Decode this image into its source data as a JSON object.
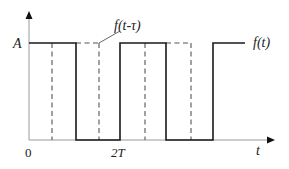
{
  "diagram": {
    "type": "timing-diagram",
    "colors": {
      "axis": "#9a9a9a",
      "signal": "#1a1a1a",
      "delayed_signal": "#555555",
      "text": "#222222"
    },
    "axes": {
      "y_label": "A",
      "x_label": "t",
      "origin_label": "0",
      "x_tick_label": "2T"
    },
    "signals": [
      {
        "name": "f(t)",
        "label": "f(t)",
        "style": "solid",
        "high_intervals_px": [
          [
            29,
            76
          ],
          [
            120,
            166
          ],
          [
            213,
            245
          ]
        ]
      },
      {
        "name": "f(t-τ)",
        "label": "f(t-τ)",
        "style": "dashed",
        "high_intervals_px": [
          [
            52,
            99
          ],
          [
            145,
            191
          ]
        ]
      }
    ]
  }
}
